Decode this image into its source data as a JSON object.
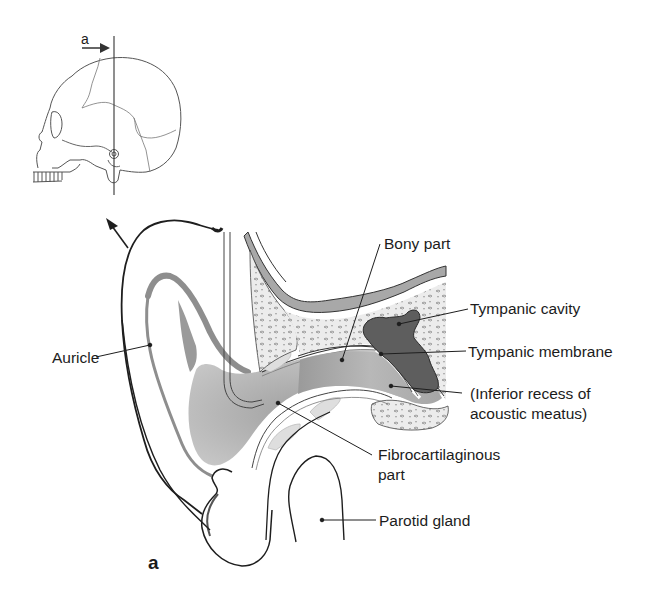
{
  "figure": {
    "panel_letter": "a",
    "inset": {
      "section_marker_label": "a",
      "section_marker_direction": "arrow-right",
      "description": "lateral view of skull with vertical section line through external acoustic meatus"
    },
    "labels": {
      "bony_part": "Bony part",
      "tympanic_cavity": "Tympanic cavity",
      "tympanic_membrane": "Tympanic membrane",
      "inferior_recess_line1": "(Inferior recess of",
      "inferior_recess_line2": "acoustic meatus)",
      "auricle": "Auricle",
      "fibrocartilaginous_line1": "Fibrocartilaginous",
      "fibrocartilaginous_line2": "part",
      "parotid_gland": "Parotid gland"
    },
    "colors": {
      "line": "#1e1e1e",
      "canal_fill": "#b4b4b4",
      "canal_dark": "#8c8c8c",
      "cavity_fill": "#5e5e5e",
      "bone_fill": "#e4e4e4",
      "bone_band": "#a8a8a8",
      "cartilage_fill": "#dcdcdc",
      "background": "#ffffff"
    }
  }
}
